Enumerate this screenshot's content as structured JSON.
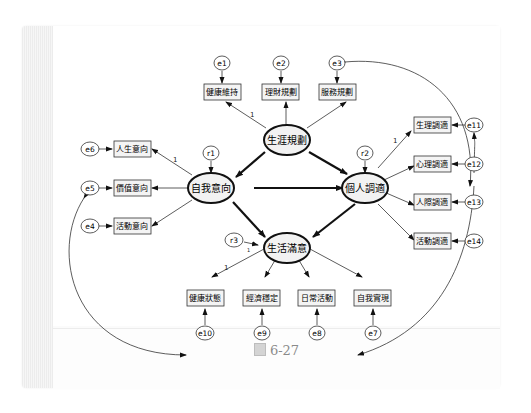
{
  "caption": {
    "label": "6-27",
    "icon": "figure-icon"
  },
  "diagram": {
    "type": "structural-equation-model",
    "latent": [
      {
        "id": "career",
        "label": "生涯規劃"
      },
      {
        "id": "self",
        "label": "自我意向"
      },
      {
        "id": "adjust",
        "label": "個人調適"
      },
      {
        "id": "life",
        "label": "生活滿意"
      }
    ],
    "observed": [
      {
        "id": "o_health_keep",
        "label": "健康維持"
      },
      {
        "id": "o_finance",
        "label": "理財規劃"
      },
      {
        "id": "o_service",
        "label": "服務規劃"
      },
      {
        "id": "o_life_dir",
        "label": "人生意向"
      },
      {
        "id": "o_value_dir",
        "label": "價值意向"
      },
      {
        "id": "o_activity_dir",
        "label": "活動意向"
      },
      {
        "id": "o_physio",
        "label": "生理調適"
      },
      {
        "id": "o_psych",
        "label": "心理調適"
      },
      {
        "id": "o_social",
        "label": "人際調適"
      },
      {
        "id": "o_activity_adj",
        "label": "活動調適"
      },
      {
        "id": "o_health_state",
        "label": "健康狀態"
      },
      {
        "id": "o_economy",
        "label": "經濟穩定"
      },
      {
        "id": "o_daily",
        "label": "日常活動"
      },
      {
        "id": "o_selfreal",
        "label": "自我實現"
      }
    ],
    "errors": [
      "e1",
      "e2",
      "e3",
      "e4",
      "e5",
      "e6",
      "e7",
      "e8",
      "e9",
      "e10",
      "e11",
      "e12",
      "e13",
      "e14"
    ],
    "residuals": [
      "r1",
      "r2",
      "r3"
    ],
    "path_label": "1"
  }
}
